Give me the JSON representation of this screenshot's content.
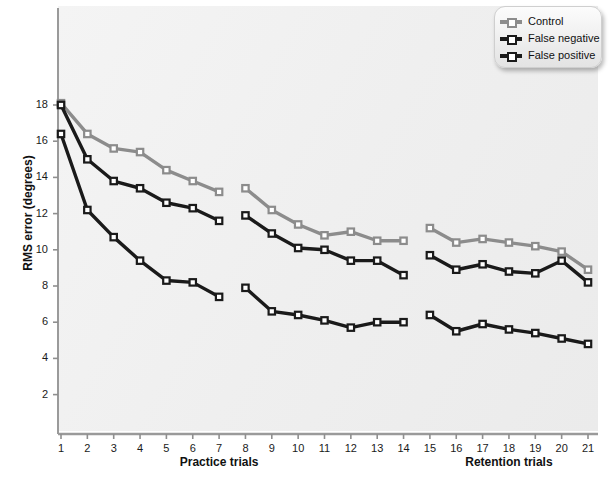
{
  "chart_data": {
    "type": "line",
    "title": "",
    "xlabel": "",
    "ylabel": "RMS error (degrees)",
    "x": [
      1,
      2,
      3,
      4,
      5,
      6,
      7,
      8,
      9,
      10,
      11,
      12,
      13,
      14,
      15,
      16,
      17,
      18,
      19,
      20,
      21
    ],
    "xtick_labels": [
      "1",
      "2",
      "3",
      "4",
      "5",
      "6",
      "7",
      "8",
      "9",
      "10",
      "11",
      "12",
      "13",
      "14",
      "15",
      "16",
      "17",
      "18",
      "19",
      "20",
      "21"
    ],
    "ytick_labels": [
      "2",
      "4",
      "6",
      "8",
      "10",
      "12",
      "14",
      "16",
      "18"
    ],
    "ylim": [
      0.6,
      19.4
    ],
    "yticks": [
      2,
      4,
      6,
      8,
      10,
      12,
      14,
      16,
      18
    ],
    "grid": false,
    "legend_position": "top-right",
    "block_labels": [
      {
        "text": "Practice trials",
        "center_trial": 7.0
      },
      {
        "text": "Retention trials",
        "center_trial": 18.0
      }
    ],
    "segments": [
      [
        1,
        7
      ],
      [
        8,
        14
      ],
      [
        15,
        21
      ]
    ],
    "series": [
      {
        "name": "Control",
        "color": "#8c8c8c",
        "marker": "open-square",
        "values": [
          18.1,
          16.4,
          15.6,
          15.4,
          14.4,
          13.8,
          13.2,
          13.4,
          12.2,
          11.4,
          10.8,
          11.0,
          10.5,
          10.5,
          11.2,
          10.4,
          10.6,
          10.4,
          10.2,
          9.9,
          8.9
        ]
      },
      {
        "name": "False negative",
        "color": "#1a1a1a",
        "marker": "open-square",
        "values": [
          18.0,
          15.0,
          13.8,
          13.4,
          12.6,
          12.3,
          11.6,
          11.9,
          10.9,
          10.1,
          10.0,
          9.4,
          9.4,
          8.6,
          9.7,
          8.9,
          9.2,
          8.8,
          8.7,
          9.4,
          8.2
        ]
      },
      {
        "name": "False positive",
        "color": "#1a1a1a",
        "marker": "open-square",
        "values": [
          16.4,
          12.2,
          10.7,
          9.4,
          8.3,
          8.2,
          7.4,
          7.9,
          6.6,
          6.4,
          6.1,
          5.7,
          6.0,
          6.0,
          6.4,
          5.5,
          5.9,
          5.6,
          5.4,
          5.1,
          4.8
        ]
      }
    ]
  },
  "legend": {
    "entries": [
      {
        "label": "Control"
      },
      {
        "label": "False negative"
      },
      {
        "label": "False positive"
      }
    ]
  }
}
